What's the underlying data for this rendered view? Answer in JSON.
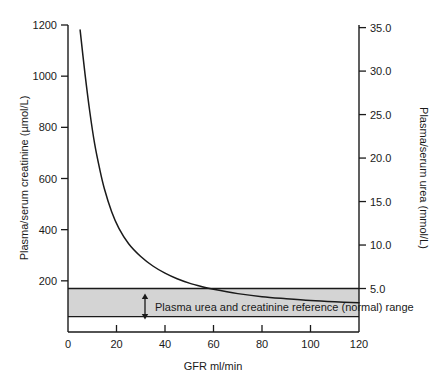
{
  "chart_data": {
    "type": "line",
    "title": "",
    "xlabel": "GFR ml/min",
    "ylabel": "Plasma/serum creatinine (µmol/L)",
    "y2label": "Plasma/serum urea (mmol/L)",
    "xlim": [
      0,
      120
    ],
    "ylim": [
      0,
      1200
    ],
    "y2lim": [
      0,
      35.3
    ],
    "grid": false,
    "legend": null,
    "xticks": [
      0,
      20,
      40,
      60,
      80,
      100,
      120
    ],
    "xticklabels": [
      "0",
      "20",
      "40",
      "60",
      "80",
      "100",
      "120"
    ],
    "yticks": [
      200,
      400,
      600,
      800,
      1000,
      1200
    ],
    "yticklabels": [
      "200",
      "400",
      "600",
      "800",
      "1000",
      "1200"
    ],
    "y2ticks": [
      5.0,
      10.0,
      15.0,
      20.0,
      25.0,
      30.0,
      35.0
    ],
    "y2ticklabels": [
      "5.0",
      "10.0",
      "15.0",
      "20.0",
      "25.0",
      "30.0",
      "35.0"
    ],
    "series": [
      {
        "name": "Plasma creatinine vs GFR",
        "x": [
          5,
          7,
          9,
          11,
          13,
          15,
          18,
          21,
          25,
          30,
          35,
          40,
          45,
          50,
          55,
          60,
          70,
          80,
          90,
          100,
          110,
          120
        ],
        "y": [
          1180,
          1010,
          860,
          735,
          640,
          560,
          470,
          405,
          345,
          295,
          258,
          230,
          208,
          191,
          178,
          167,
          150,
          138,
          130,
          123,
          118,
          114
        ]
      }
    ],
    "band": {
      "label": "Plasma urea and creatinine reference (normal) range",
      "creatinine_upper": 170,
      "creatinine_lower": 60,
      "urea_upper": 5.0,
      "urea_lower": 1.8,
      "fill_color": "#d4d4d4",
      "edge_color": "#1a1a1a",
      "arrow": "double-headed-vertical"
    },
    "line_color": "#1a1a1a",
    "axis_color": "#1a1a1a",
    "background": "#ffffff"
  }
}
